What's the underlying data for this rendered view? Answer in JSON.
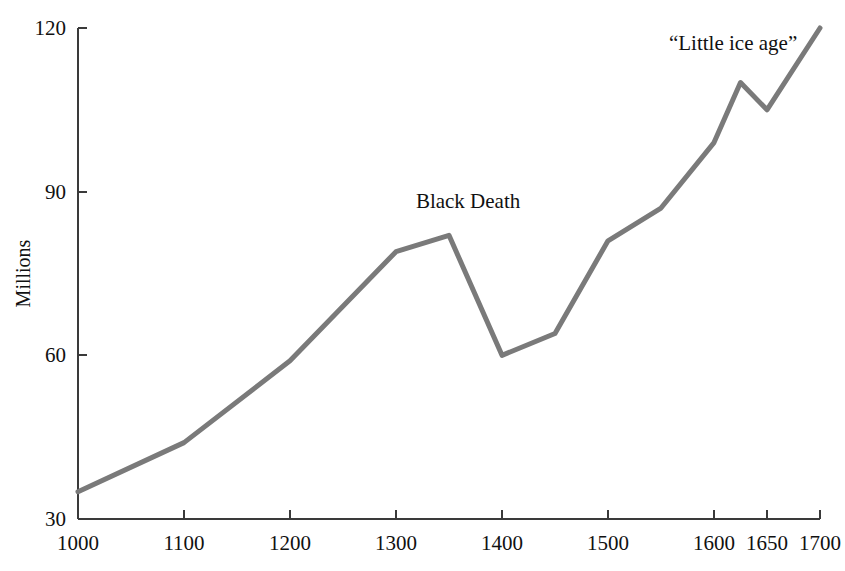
{
  "chart_data": {
    "type": "line",
    "title": "",
    "subtitle": "",
    "xlabel": "",
    "ylabel": "Millions",
    "xlim": [
      1000,
      1700
    ],
    "ylim": [
      30,
      120
    ],
    "xticks": [
      1000,
      1100,
      1200,
      1300,
      1400,
      1500,
      1600,
      1650,
      1700
    ],
    "xtick_labels": [
      "1000",
      "1100",
      "1200",
      "1300",
      "1400",
      "1500",
      "1600",
      "1650",
      "1700"
    ],
    "yticks": [
      30,
      60,
      90,
      120
    ],
    "ytick_labels": [
      "30",
      "60",
      "90",
      "120"
    ],
    "grid": false,
    "legend": "none",
    "line_color": "#7a7a7a",
    "axis_color": "#3a3a3a",
    "line_width": 5,
    "series": [
      {
        "name": "Population",
        "x": [
          1000,
          1100,
          1200,
          1300,
          1350,
          1400,
          1450,
          1500,
          1550,
          1600,
          1625,
          1650,
          1700
        ],
        "values": [
          35,
          44,
          59,
          79,
          82,
          60,
          64,
          81,
          87,
          99,
          110,
          105,
          120
        ]
      }
    ],
    "annotations": [
      {
        "text": "Black Death",
        "x": 1368,
        "y": 87,
        "anchor": "middle"
      },
      {
        "text": "“Little ice age”",
        "x": 1618,
        "y": 116,
        "anchor": "middle"
      }
    ]
  }
}
